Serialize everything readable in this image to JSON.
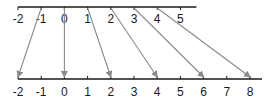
{
  "diagram": {
    "title": "",
    "top_axis": {
      "labels": [
        "-2",
        "-1",
        "0",
        "1",
        "2",
        "3",
        "4",
        "5"
      ],
      "values": [
        -2,
        -1,
        0,
        1,
        2,
        3,
        4,
        5
      ]
    },
    "bottom_axis": {
      "labels": [
        "-2",
        "-1",
        "0",
        "1",
        "2",
        "3",
        "4",
        "5",
        "6",
        "7",
        "8"
      ],
      "values": [
        -2,
        -1,
        0,
        1,
        2,
        3,
        4,
        5,
        6,
        7,
        8
      ]
    },
    "mappings": [
      {
        "from": -1,
        "to": -2
      },
      {
        "from": 0,
        "to": 0
      },
      {
        "from": 1,
        "to": 2
      },
      {
        "from": 2,
        "to": 4
      },
      {
        "from": 3,
        "to": 6
      },
      {
        "from": 4,
        "to": 8
      }
    ],
    "colors": {
      "axis": "#1a1a1a",
      "arrow": "#8a8a8a",
      "text": "#1a1a1a"
    }
  }
}
